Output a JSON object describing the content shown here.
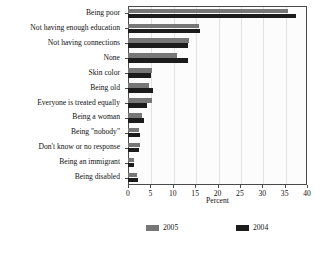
{
  "chart_data": {
    "type": "bar",
    "orientation": "horizontal",
    "title": "",
    "xlabel": "Percent",
    "ylabel": "",
    "xlim": [
      0,
      40
    ],
    "xticks": [
      0,
      5,
      10,
      15,
      20,
      25,
      30,
      35,
      40
    ],
    "grid": true,
    "legend_position": "bottom",
    "categories": [
      "Being poor",
      "Not having enough education",
      "Not having connections",
      "None",
      "Skin color",
      "Being old",
      "Everyone is treated equally",
      "Being a woman",
      "Being \"nobody\"",
      "Don't know or no response",
      "Being an immigrant",
      "Being disabled"
    ],
    "series": [
      {
        "name": "2005",
        "color": "#777777",
        "values": [
          35.7,
          15.9,
          13.6,
          11.0,
          5.3,
          4.6,
          5.4,
          3.2,
          2.5,
          2.6,
          1.3,
          2.0
        ]
      },
      {
        "name": "2004",
        "color": "#1c1c1c",
        "values": [
          37.5,
          16.0,
          13.5,
          13.5,
          5.2,
          5.5,
          4.3,
          3.6,
          2.7,
          2.5,
          1.4,
          2.2
        ]
      }
    ]
  },
  "legend": {
    "items": [
      {
        "label": "2005"
      },
      {
        "label": "2004"
      }
    ]
  },
  "footnote": ""
}
